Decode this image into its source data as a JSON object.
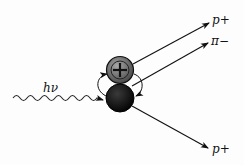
{
  "diagram": {
    "photon_label": "hν",
    "nucleons": [
      {
        "name": "proton",
        "symbol": "+",
        "color": "#6e6e6e"
      },
      {
        "name": "neutron",
        "color": "#111111"
      }
    ],
    "outgoing": [
      {
        "label": "p+",
        "direction": "upper"
      },
      {
        "label": "π−",
        "direction": "middle"
      },
      {
        "label": "p+",
        "direction": "lower"
      }
    ]
  }
}
